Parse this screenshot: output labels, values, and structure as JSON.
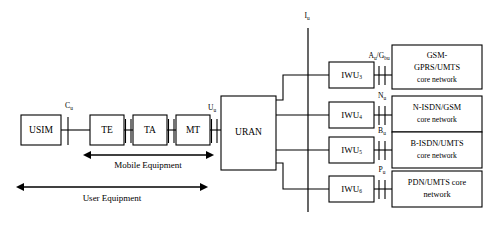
{
  "diagram": {
    "ue_chain": {
      "boxes": [
        {
          "id": "usim",
          "label": "USIM"
        },
        {
          "id": "te",
          "label": "TE"
        },
        {
          "id": "ta",
          "label": "TA"
        },
        {
          "id": "mt",
          "label": "MT"
        }
      ],
      "access_network": {
        "id": "uran",
        "label": "URAN"
      },
      "reference_points": [
        {
          "id": "cu",
          "base": "C",
          "sub": "u"
        },
        {
          "id": "uu",
          "base": "U",
          "sub": "u"
        }
      ],
      "spans": [
        {
          "id": "mobile-equipment",
          "label": "Mobile Equipment"
        },
        {
          "id": "user-equipment",
          "label": "User Equipment"
        }
      ]
    },
    "iu_interface": {
      "base": "I",
      "sub": "u"
    },
    "branches": [
      {
        "iwu": {
          "base": "IWU",
          "sub": "3"
        },
        "interface": {
          "base": "A",
          "sub": "u",
          "base2": "/G",
          "sub2": "bu"
        },
        "network_lines": [
          "GSM-",
          "GPRS/UMTS",
          "core network"
        ]
      },
      {
        "iwu": {
          "base": "IWU",
          "sub": "4"
        },
        "interface": {
          "base": "N",
          "sub": "u",
          "base2": "",
          "sub2": ""
        },
        "network_lines": [
          "N-ISDN/GSM",
          "core network"
        ]
      },
      {
        "iwu": {
          "base": "IWU",
          "sub": "5"
        },
        "interface": {
          "base": "B",
          "sub": "u",
          "base2": "",
          "sub2": ""
        },
        "network_lines": [
          "B-ISDN/UMTS",
          "core network"
        ]
      },
      {
        "iwu": {
          "base": "IWU",
          "sub": "6"
        },
        "interface": {
          "base": "P",
          "sub": "u",
          "base2": "",
          "sub2": ""
        },
        "network_lines": [
          "PDN/UMTS core",
          "network"
        ]
      }
    ],
    "colors": {
      "stroke": "#000000",
      "fill": "#ffffff"
    }
  }
}
